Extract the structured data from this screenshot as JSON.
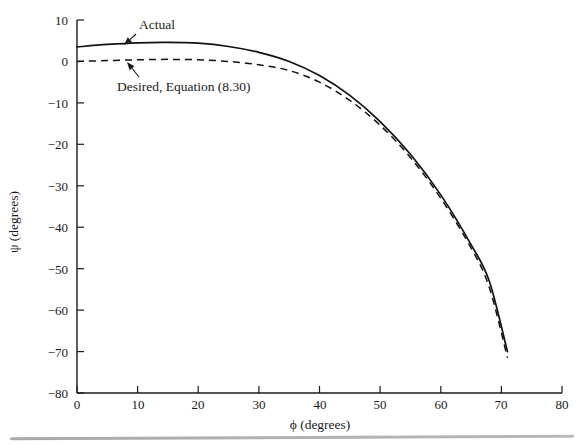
{
  "chart_data": {
    "type": "line",
    "title": "",
    "xlabel": "ϕ (degrees)",
    "ylabel": "ψ (degrees)",
    "xlim": [
      0,
      80
    ],
    "ylim": [
      -80,
      10
    ],
    "xticks": [
      0,
      10,
      20,
      30,
      40,
      50,
      60,
      70,
      80
    ],
    "yticks": [
      10,
      0,
      -10,
      -20,
      -30,
      -40,
      -50,
      -60,
      -70,
      -80
    ],
    "xtick_labels": [
      "0",
      "10",
      "20",
      "30",
      "40",
      "50",
      "60",
      "70",
      "80"
    ],
    "ytick_labels": [
      "10",
      "0",
      "−10",
      "−20",
      "−30",
      "−40",
      "−50",
      "−60",
      "−70",
      "−80"
    ],
    "grid": false,
    "legend_position": "inline-annotations",
    "series": [
      {
        "name": "Actual",
        "style": "solid",
        "color": "#111111",
        "x": [
          0,
          5,
          10,
          15,
          20,
          25,
          30,
          35,
          40,
          45,
          50,
          55,
          60,
          65,
          68,
          71
        ],
        "values": [
          3.5,
          4.1,
          4.5,
          4.6,
          4.4,
          3.6,
          2.2,
          0.0,
          -3.4,
          -8.2,
          -14.5,
          -22.4,
          -32.2,
          -44.2,
          -53.0,
          -70.0
        ]
      },
      {
        "name": "Desired, Equation (8.30)",
        "style": "dashed",
        "color": "#111111",
        "x": [
          0,
          5,
          10,
          15,
          20,
          25,
          30,
          35,
          40,
          45,
          50,
          55,
          60,
          65,
          68,
          71
        ],
        "values": [
          0.0,
          0.2,
          0.4,
          0.5,
          0.4,
          0.0,
          -0.8,
          -2.2,
          -5.0,
          -9.4,
          -15.4,
          -23.2,
          -33.0,
          -45.0,
          -54.5,
          -71.5
        ]
      }
    ],
    "annotations": [
      {
        "name": "actual-annotation",
        "text": "Actual",
        "label_x": 139,
        "label_y": 18,
        "arrow_from": [
          136,
          34
        ],
        "arrow_to": [
          124,
          45
        ]
      },
      {
        "name": "desired-annotation",
        "text": "Desired, Equation (8.30)",
        "label_x": 117,
        "label_y": 80,
        "arrow_from": [
          139,
          77
        ],
        "arrow_to": [
          127,
          62
        ]
      }
    ]
  },
  "axes": {
    "x_title": "ϕ (degrees)",
    "y_title": "ψ (degrees)"
  },
  "footer": {
    "rule": "horizontal-rule"
  }
}
